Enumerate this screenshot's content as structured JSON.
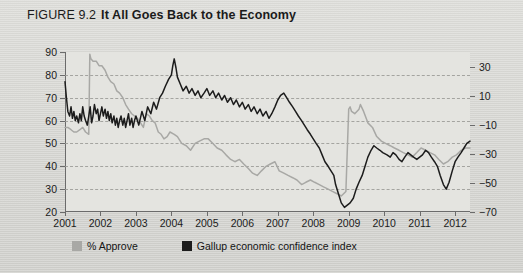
{
  "figure": {
    "label": "FIGURE 9.2",
    "title": "It All Goes Back to the Economy"
  },
  "legend": [
    {
      "label": "% Approve",
      "color": "#a8a8a5",
      "key": "approve"
    },
    {
      "label": "Gallup economic confidence index",
      "color": "#1c1c1c",
      "key": "confidence"
    }
  ],
  "chart_data": {
    "type": "line",
    "title": "It All Goes Back to the Economy",
    "xlabel": "",
    "ylabel": "",
    "grid": true,
    "legend_position": "bottom-left",
    "xlim": [
      2001,
      2012.42
    ],
    "xticks": [
      "2001",
      "2002",
      "2003",
      "2004",
      "2005",
      "2006",
      "2007",
      "2008",
      "2009",
      "2010",
      "2011",
      "2012"
    ],
    "left_axis": {
      "name": "% Approve",
      "ylim": [
        20,
        90
      ],
      "ticks": [
        20,
        30,
        40,
        50,
        60,
        70,
        80,
        90
      ]
    },
    "right_axis": {
      "name": "Gallup economic confidence index",
      "ylim": [
        -70,
        40
      ],
      "ticks": [
        30,
        10,
        -10,
        -30,
        -50,
        -70
      ],
      "tick_labels": [
        "30",
        "10",
        "−10",
        "−30",
        "−50",
        "−70"
      ]
    },
    "gridlines_left": [
      30,
      40,
      50,
      60,
      70,
      80
    ],
    "series": [
      {
        "name": "% Approve",
        "color": "#a8a8a5",
        "axis": "left",
        "x": [
          2001.0,
          2001.08,
          2001.17,
          2001.25,
          2001.33,
          2001.42,
          2001.5,
          2001.58,
          2001.67,
          2001.7,
          2001.73,
          2001.79,
          2001.88,
          2001.96,
          2002.04,
          2002.13,
          2002.21,
          2002.29,
          2002.38,
          2002.46,
          2002.54,
          2002.63,
          2002.71,
          2002.79,
          2002.88,
          2002.96,
          2003.04,
          2003.13,
          2003.21,
          2003.29,
          2003.38,
          2003.46,
          2003.54,
          2003.63,
          2003.71,
          2003.79,
          2003.88,
          2003.96,
          2004.08,
          2004.17,
          2004.29,
          2004.42,
          2004.54,
          2004.67,
          2004.79,
          2004.92,
          2005.04,
          2005.17,
          2005.29,
          2005.42,
          2005.54,
          2005.67,
          2005.79,
          2005.92,
          2006.04,
          2006.17,
          2006.29,
          2006.42,
          2006.54,
          2006.67,
          2006.79,
          2006.92,
          2007.04,
          2007.17,
          2007.29,
          2007.42,
          2007.54,
          2007.67,
          2007.79,
          2007.92,
          2008.04,
          2008.17,
          2008.29,
          2008.42,
          2008.54,
          2008.67,
          2008.79,
          2008.92,
          2009.0,
          2009.04,
          2009.08,
          2009.17,
          2009.29,
          2009.33,
          2009.42,
          2009.54,
          2009.67,
          2009.79,
          2009.92,
          2010.04,
          2010.17,
          2010.29,
          2010.42,
          2010.54,
          2010.67,
          2010.79,
          2010.92,
          2011.04,
          2011.17,
          2011.29,
          2011.42,
          2011.54,
          2011.67,
          2011.79,
          2011.92,
          2012.04,
          2012.17,
          2012.29,
          2012.42
        ],
        "values": [
          57,
          57,
          56,
          55,
          55,
          56,
          57,
          55,
          54,
          89,
          87,
          86,
          86,
          84,
          84,
          82,
          79,
          77,
          76,
          73,
          72,
          70,
          67,
          65,
          63,
          62,
          61,
          59,
          57,
          63,
          62,
          60,
          59,
          55,
          54,
          52,
          53,
          55,
          54,
          53,
          50,
          49,
          47,
          50,
          51,
          52,
          52,
          50,
          48,
          47,
          45,
          43,
          42,
          43,
          41,
          39,
          37,
          36,
          38,
          40,
          41,
          42,
          38,
          37,
          36,
          35,
          34,
          32,
          33,
          34,
          33,
          32,
          31,
          30,
          29,
          28,
          27,
          29,
          65,
          66,
          64,
          63,
          65,
          67,
          64,
          59,
          57,
          53,
          51,
          50,
          49,
          48,
          47,
          46,
          45,
          44,
          46,
          48,
          47,
          46,
          45,
          43,
          41,
          42,
          44,
          45,
          47,
          48,
          48
        ]
      },
      {
        "name": "Gallup economic confidence index",
        "color": "#1c1c1c",
        "axis": "left_mapped",
        "x": [
          2001.0,
          2001.04,
          2001.08,
          2001.13,
          2001.17,
          2001.21,
          2001.25,
          2001.29,
          2001.33,
          2001.38,
          2001.42,
          2001.46,
          2001.5,
          2001.54,
          2001.58,
          2001.63,
          2001.67,
          2001.71,
          2001.75,
          2001.79,
          2001.83,
          2001.88,
          2001.92,
          2001.96,
          2002.0,
          2002.04,
          2002.08,
          2002.13,
          2002.17,
          2002.21,
          2002.25,
          2002.29,
          2002.33,
          2002.38,
          2002.42,
          2002.46,
          2002.5,
          2002.54,
          2002.58,
          2002.63,
          2002.67,
          2002.71,
          2002.75,
          2002.79,
          2002.83,
          2002.88,
          2002.92,
          2002.96,
          2003.0,
          2003.08,
          2003.17,
          2003.25,
          2003.33,
          2003.42,
          2003.5,
          2003.58,
          2003.67,
          2003.75,
          2003.83,
          2003.92,
          2004.0,
          2004.04,
          2004.08,
          2004.13,
          2004.17,
          2004.25,
          2004.33,
          2004.42,
          2004.5,
          2004.58,
          2004.67,
          2004.75,
          2004.83,
          2004.92,
          2005.0,
          2005.08,
          2005.17,
          2005.25,
          2005.33,
          2005.42,
          2005.5,
          2005.58,
          2005.67,
          2005.75,
          2005.83,
          2005.92,
          2006.0,
          2006.08,
          2006.17,
          2006.25,
          2006.33,
          2006.42,
          2006.5,
          2006.58,
          2006.67,
          2006.75,
          2006.83,
          2006.92,
          2007.0,
          2007.08,
          2007.17,
          2007.25,
          2007.33,
          2007.42,
          2007.5,
          2007.58,
          2007.67,
          2007.75,
          2007.83,
          2007.92,
          2008.0,
          2008.08,
          2008.17,
          2008.25,
          2008.33,
          2008.42,
          2008.5,
          2008.58,
          2008.63,
          2008.71,
          2008.79,
          2008.88,
          2008.96,
          2009.04,
          2009.13,
          2009.21,
          2009.29,
          2009.38,
          2009.46,
          2009.54,
          2009.63,
          2009.71,
          2009.79,
          2009.88,
          2009.96,
          2010.08,
          2010.17,
          2010.25,
          2010.33,
          2010.42,
          2010.5,
          2010.58,
          2010.67,
          2010.75,
          2010.83,
          2010.92,
          2011.0,
          2011.08,
          2011.17,
          2011.25,
          2011.33,
          2011.42,
          2011.5,
          2011.58,
          2011.67,
          2011.75,
          2011.83,
          2011.92,
          2012.0,
          2012.08,
          2012.17,
          2012.25,
          2012.33,
          2012.42
        ],
        "values": [
          77,
          70,
          64,
          62,
          66,
          61,
          64,
          60,
          62,
          59,
          63,
          60,
          66,
          62,
          60,
          58,
          62,
          66,
          59,
          62,
          67,
          63,
          65,
          60,
          63,
          66,
          62,
          65,
          61,
          64,
          60,
          63,
          59,
          62,
          58,
          61,
          57,
          60,
          62,
          58,
          61,
          57,
          60,
          63,
          58,
          61,
          57,
          60,
          62,
          58,
          64,
          60,
          66,
          63,
          68,
          65,
          70,
          72,
          75,
          78,
          80,
          84,
          87,
          83,
          79,
          76,
          73,
          75,
          72,
          74,
          71,
          73,
          70,
          72,
          74,
          71,
          73,
          70,
          72,
          69,
          71,
          68,
          70,
          67,
          69,
          66,
          68,
          65,
          67,
          64,
          66,
          63,
          65,
          62,
          64,
          61,
          63,
          66,
          69,
          71,
          72,
          70,
          68,
          66,
          64,
          62,
          60,
          58,
          56,
          54,
          52,
          50,
          48,
          45,
          42,
          40,
          38,
          36,
          32,
          28,
          24,
          22,
          23,
          24,
          26,
          30,
          33,
          36,
          40,
          44,
          47,
          49,
          48,
          47,
          46,
          45,
          44,
          46,
          45,
          43,
          42,
          44,
          46,
          45,
          44,
          43,
          44,
          45,
          47,
          46,
          44,
          42,
          40,
          36,
          32,
          30,
          33,
          38,
          42,
          44,
          46,
          48,
          50,
          51
        ]
      }
    ],
    "annotations": []
  }
}
